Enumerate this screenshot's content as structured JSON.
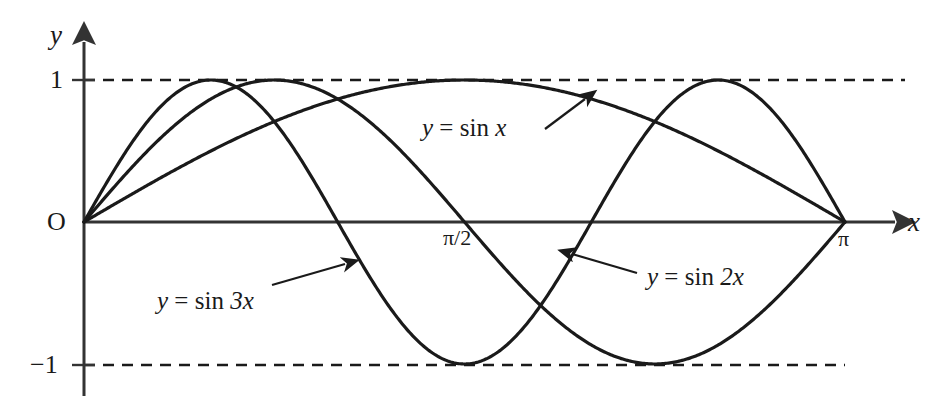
{
  "chart_data": {
    "type": "line",
    "title": "",
    "xlabel": "x",
    "ylabel": "y",
    "xlim": [
      0,
      3.141592653589793
    ],
    "ylim": [
      -1.25,
      1.25
    ],
    "grid": false,
    "legend_position": "inline-annotations",
    "x_ticks": [
      {
        "value": 1.5707963267948966,
        "label": "π/2"
      },
      {
        "value": 3.141592653589793,
        "label": "π"
      }
    ],
    "y_ticks": [
      {
        "value": 1,
        "label": "1"
      },
      {
        "value": 0,
        "label": "O"
      },
      {
        "value": -1,
        "label": "−1"
      }
    ],
    "reference_lines": [
      {
        "value": 1,
        "style": "dashed",
        "label": "y = 1"
      },
      {
        "value": -1,
        "style": "dashed",
        "label": "y = -1"
      }
    ],
    "series": [
      {
        "name": "y = sin x",
        "frequency": 1,
        "amplitude": 1,
        "color": "#1a1a1a",
        "zeros": [
          0,
          3.141592653589793
        ],
        "maxima": [
          {
            "x": 1.5707963267948966,
            "y": 1
          }
        ],
        "minima": []
      },
      {
        "name": "y = sin 2x",
        "frequency": 2,
        "amplitude": 1,
        "color": "#1a1a1a",
        "zeros": [
          0,
          1.5707963267948966,
          3.141592653589793
        ],
        "maxima": [
          {
            "x": 0.7853981633974483,
            "y": 1
          }
        ],
        "minima": [
          {
            "x": 2.356194490192345,
            "y": -1
          }
        ]
      },
      {
        "name": "y = sin 3x",
        "frequency": 3,
        "amplitude": 1,
        "color": "#1a1a1a",
        "zeros": [
          0,
          1.0471975511965976,
          2.0943951023931953,
          3.141592653589793
        ],
        "maxima": [
          {
            "x": 0.5235987755982988,
            "y": 1
          },
          {
            "x": 2.6179938779914944,
            "y": 1
          }
        ],
        "minima": [
          {
            "x": 1.5707963267948966,
            "y": -1
          }
        ]
      }
    ],
    "annotations": [
      {
        "id": "sinx",
        "text_parts": {
          "y": "y",
          "eq": " = ",
          "fn": "sin ",
          "arg": "x"
        },
        "full_text": "y = sin x",
        "text_x": 422,
        "text_y": 115,
        "arrow_from_x": 545,
        "arrow_from_y": 129,
        "arrow_to_x": 585,
        "arrow_to_y": 99
      },
      {
        "id": "sin2x",
        "text_parts": {
          "y": "y",
          "eq": " = ",
          "fn": "sin ",
          "arg": "2x"
        },
        "full_text": "y = sin 2x",
        "text_x": 647,
        "text_y": 264,
        "arrow_from_x": 637,
        "arrow_from_y": 273,
        "arrow_to_x": 572,
        "arrow_to_y": 254
      },
      {
        "id": "sin3x",
        "text_parts": {
          "y": "y",
          "eq": " = ",
          "fn": "sin ",
          "arg": "3x"
        },
        "full_text": "y = sin 3x",
        "text_x": 157,
        "text_y": 288,
        "arrow_from_x": 272,
        "arrow_from_y": 285,
        "arrow_to_x": 345,
        "arrow_to_y": 264
      }
    ]
  },
  "figure": {
    "background_color": "#ffffff",
    "line_color": "#1a1a1a",
    "axis_color": "#333333",
    "axis_label_y": "y",
    "axis_label_x": "x",
    "origin_label": "O",
    "tick_label_one": "1",
    "tick_label_neg_one": "−1",
    "tick_label_pi_half": "π/2",
    "tick_label_pi": "π"
  }
}
